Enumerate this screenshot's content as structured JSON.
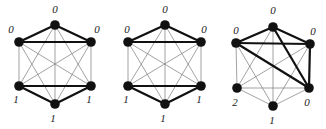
{
  "figure": {
    "colors": {
      "node": "#111111",
      "thin_edge": "#7a7a7a",
      "thick_edge": "#111111",
      "label": "#222222"
    }
  },
  "graphs": [
    {
      "id": "graph-1",
      "nodes": [
        {
          "id": "top",
          "x": 55,
          "y": 25,
          "label": "0",
          "lx": 55,
          "ly": 13
        },
        {
          "id": "ul",
          "x": 19,
          "y": 42,
          "label": "0",
          "lx": 11,
          "ly": 33
        },
        {
          "id": "ur",
          "x": 91,
          "y": 42,
          "label": "0",
          "lx": 97,
          "ly": 33
        },
        {
          "id": "ll",
          "x": 19,
          "y": 86,
          "label": "1",
          "lx": 16,
          "ly": 103
        },
        {
          "id": "lr",
          "x": 91,
          "y": 86,
          "label": "1",
          "lx": 89,
          "ly": 103
        },
        {
          "id": "bot",
          "x": 55,
          "y": 104,
          "label": "1",
          "lx": 53,
          "ly": 122
        }
      ],
      "thick_edges": [
        [
          "top",
          "ul"
        ],
        [
          "top",
          "ur"
        ],
        [
          "ul",
          "ur"
        ],
        [
          "ll",
          "lr"
        ],
        [
          "ll",
          "bot"
        ],
        [
          "lr",
          "bot"
        ]
      ]
    },
    {
      "id": "graph-2",
      "nodes": [
        {
          "id": "top",
          "x": 165,
          "y": 25,
          "label": "0",
          "lx": 165,
          "ly": 13
        },
        {
          "id": "ul",
          "x": 128,
          "y": 42,
          "label": "0",
          "lx": 127,
          "ly": 33
        },
        {
          "id": "ur",
          "x": 201,
          "y": 42,
          "label": "0",
          "lx": 204,
          "ly": 33
        },
        {
          "id": "ll",
          "x": 128,
          "y": 86,
          "label": "1",
          "lx": 126,
          "ly": 103
        },
        {
          "id": "lr",
          "x": 201,
          "y": 86,
          "label": "1",
          "lx": 199,
          "ly": 103
        },
        {
          "id": "bot",
          "x": 165,
          "y": 104,
          "label": "1",
          "lx": 163,
          "ly": 122
        }
      ],
      "thick_edges": [
        [
          "top",
          "ul"
        ],
        [
          "top",
          "ur"
        ],
        [
          "ul",
          "ur"
        ],
        [
          "ll",
          "lr"
        ],
        [
          "ll",
          "bot"
        ],
        [
          "lr",
          "bot"
        ]
      ]
    },
    {
      "id": "graph-3",
      "nodes": [
        {
          "id": "top",
          "x": 273,
          "y": 27,
          "label": "0",
          "lx": 273,
          "ly": 14
        },
        {
          "id": "ul",
          "x": 236,
          "y": 43,
          "label": "0",
          "lx": 236,
          "ly": 34
        },
        {
          "id": "ur",
          "x": 310,
          "y": 44,
          "label": "0",
          "lx": 313,
          "ly": 35
        },
        {
          "id": "ll",
          "x": 237,
          "y": 88,
          "label": "2",
          "lx": 235,
          "ly": 106
        },
        {
          "id": "lr",
          "x": 309,
          "y": 88,
          "label": "0",
          "lx": 307,
          "ly": 106
        },
        {
          "id": "bot",
          "x": 273,
          "y": 106,
          "label": "1",
          "lx": 272,
          "ly": 124
        }
      ],
      "thick_edges": [
        [
          "top",
          "ul"
        ],
        [
          "top",
          "ur"
        ],
        [
          "ul",
          "ur"
        ],
        [
          "top",
          "lr"
        ],
        [
          "ul",
          "lr"
        ],
        [
          "ur",
          "lr"
        ]
      ]
    }
  ]
}
